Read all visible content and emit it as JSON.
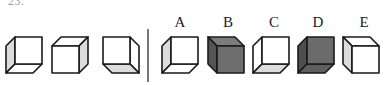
{
  "question": {
    "number": "23."
  },
  "colors": {
    "edge": "#1a1a1a",
    "white": "#ffffff",
    "light_gray": "#dcdcdc",
    "divider": "#555555"
  },
  "stem_cubes": [
    {
      "id": "stem-1",
      "front_position": "top-right",
      "faces": {
        "front": "#ffffff",
        "side_left": "#dcdcdc",
        "bottom": "#ffffff"
      }
    },
    {
      "id": "stem-2",
      "front_position": "bottom-left",
      "faces": {
        "front": "#ffffff",
        "top": "#ffffff",
        "side_right": "#dcdcdc"
      }
    },
    {
      "id": "stem-3",
      "front_position": "top-left",
      "faces": {
        "front": "#ffffff",
        "side_right": "#ffffff",
        "bottom": "#dcdcdc"
      }
    }
  ],
  "options": [
    {
      "label": "A",
      "front_position": "top-right",
      "faces": {
        "front": "#ffffff",
        "side_left": "#dcdcdc",
        "bottom": "#ffffff"
      }
    },
    {
      "label": "B",
      "front_position": "bottom-right",
      "faces": {
        "front": "#6e6e6e",
        "top": "#7c7c7c",
        "side_left": "#555555"
      }
    },
    {
      "label": "C",
      "front_position": "top-right",
      "faces": {
        "front": "#ffffff",
        "side_left": "#ffffff",
        "bottom": "#dcdcdc"
      }
    },
    {
      "label": "D",
      "front_position": "top-right",
      "faces": {
        "front": "#6b6b6b",
        "side_left": "#4e4e4e",
        "bottom": "#5e5e5e"
      }
    },
    {
      "label": "E",
      "front_position": "bottom-right",
      "faces": {
        "front": "#ffffff",
        "top": "#ffffff",
        "side_left": "#dcdcdc"
      }
    }
  ]
}
